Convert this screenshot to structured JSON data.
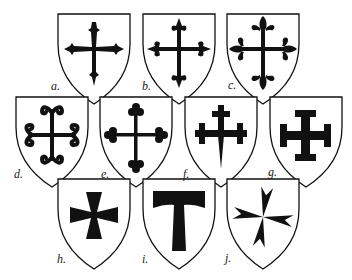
{
  "figure": {
    "shields": [
      {
        "id": "a",
        "label": "a.",
        "x": 58,
        "y": 14,
        "w": 73,
        "row": 1,
        "cross": "patonce"
      },
      {
        "id": "b",
        "label": "b.",
        "x": 143,
        "y": 14,
        "w": 73,
        "row": 1,
        "cross": "fleury"
      },
      {
        "id": "c",
        "label": "c.",
        "x": 227,
        "y": 14,
        "w": 73,
        "row": 1,
        "cross": "fleury-ornate"
      },
      {
        "id": "d",
        "label": "d.",
        "x": 16,
        "y": 97,
        "w": 72,
        "row": 2,
        "cross": "moline"
      },
      {
        "id": "e",
        "label": "e.",
        "x": 100,
        "y": 97,
        "w": 73,
        "row": 2,
        "cross": "botonny"
      },
      {
        "id": "f",
        "label": "f.",
        "x": 185,
        "y": 97,
        "w": 72,
        "row": 2,
        "cross": "crosslet-fitchy"
      },
      {
        "id": "g",
        "label": "g.",
        "x": 270,
        "y": 97,
        "w": 71,
        "row": 2,
        "cross": "potent"
      },
      {
        "id": "h",
        "label": "h.",
        "x": 58,
        "y": 179,
        "w": 72,
        "row": 3,
        "cross": "formy"
      },
      {
        "id": "i",
        "label": "i.",
        "x": 143,
        "y": 179,
        "w": 72,
        "row": 3,
        "cross": "tau"
      },
      {
        "id": "j",
        "label": "j.",
        "x": 227,
        "y": 179,
        "w": 73,
        "row": 3,
        "cross": "maltese"
      }
    ]
  },
  "colors": {
    "ink": "#111111",
    "paper": "#ffffff"
  }
}
